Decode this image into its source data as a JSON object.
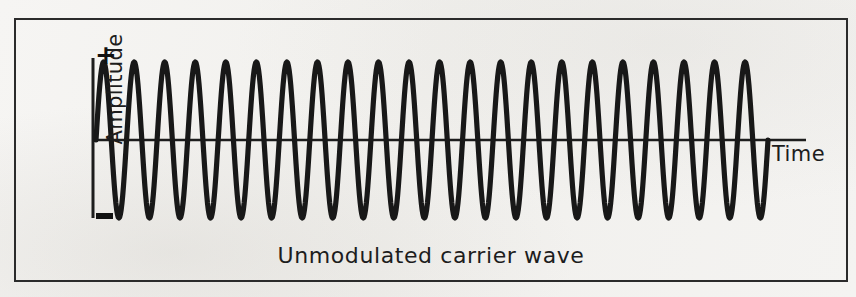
{
  "figure": {
    "caption": "Unmodulated carrier wave",
    "border_color": "#2b2b2b",
    "background_color": "#f3f2f0",
    "ink_color": "#111111"
  },
  "axes": {
    "y_label": "Amplitude",
    "x_label": "Time",
    "positive_marker": "+",
    "negative_marker": "—",
    "y_axis_line": {
      "x": 93,
      "y_top": 58,
      "y_bottom": 218
    },
    "x_axis_line": {
      "y": 140,
      "x_left": 93,
      "x_right": 806
    }
  },
  "chart_data": {
    "type": "line",
    "title": "Unmodulated carrier wave",
    "xlabel": "Time",
    "ylabel": "Amplitude",
    "grid": false,
    "legend": "none",
    "xlim": [
      0,
      22
    ],
    "ylim": [
      -1,
      1
    ],
    "x_tick_labels": [],
    "y_tick_labels": [
      "+",
      "—"
    ],
    "annotations": [
      "+",
      "—",
      "Time",
      "Amplitude"
    ],
    "series": [
      {
        "name": "carrier",
        "waveform": "sine",
        "cycles": 22,
        "amplitude": 1,
        "amplitude_modulation": "none",
        "phase_deg": 0,
        "description": "Constant-amplitude sinusoidal carrier, 22 full cycles drawn left to right at uniform peak height."
      }
    ]
  },
  "wave_render": {
    "x_start": 96,
    "x_end": 768,
    "y_center": 140,
    "amplitude_px": 78,
    "cycles": 22,
    "stroke_width": 5.2,
    "stroke_color": "#181818"
  }
}
